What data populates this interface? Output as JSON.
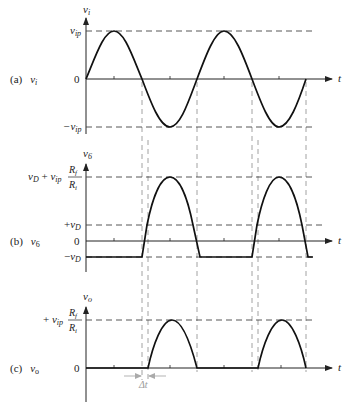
{
  "figure": {
    "panels": [
      {
        "id": "a",
        "tag": "(a)",
        "signal": "v",
        "signal_sub": "i",
        "axis_label": "v",
        "axis_label_sub": "i",
        "levels": {
          "top": {
            "text": "v",
            "sub": "ip"
          },
          "zero": "0",
          "bottom": {
            "prefix": "−",
            "text": "v",
            "sub": "ip"
          }
        },
        "time_label": "t",
        "waveform": "sine, two full periods starting at 0"
      },
      {
        "id": "b",
        "tag": "(b)",
        "signal": "v",
        "signal_sub": "6",
        "axis_label": "v",
        "axis_label_sub": "6",
        "levels": {
          "top": {
            "v": "v",
            "d": "D",
            "plus": " + ",
            "vip": "v",
            "ip": "ip",
            "num": "R",
            "num_sub": "f",
            "den": "R",
            "den_sub": "i"
          },
          "plus_vd": {
            "prefix": "+",
            "text": "v",
            "sub": "D"
          },
          "zero": "0",
          "minus_vd": {
            "prefix": "−",
            "text": "v",
            "sub": "D"
          }
        },
        "time_label": "t",
        "waveform": "clipped at −vD during negative half cycles; vD + vip·Rf/Ri peaks during positive half cycles"
      },
      {
        "id": "c",
        "tag": "(c)",
        "signal": "v",
        "signal_sub": "o",
        "axis_label": "v",
        "axis_label_sub": "o",
        "levels": {
          "top": {
            "prefix": "+ ",
            "vip": "v",
            "ip": "ip",
            "num": "R",
            "num_sub": "f",
            "den": "R",
            "den_sub": "i"
          },
          "zero": "0"
        },
        "time_label": "t",
        "delay_label": "Δt",
        "waveform": "half-wave rectified, delayed by Δt"
      }
    ],
    "colors": {
      "trace": "#111111",
      "axis": "#222222",
      "guide_dashed": "#444444",
      "vertical_guides": "#888888",
      "delta_t": "#999999"
    }
  }
}
